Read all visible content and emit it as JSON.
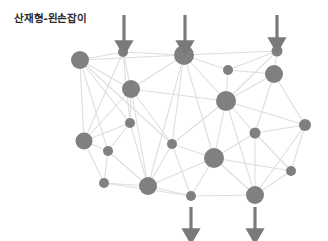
{
  "figure": {
    "title": "산재형-왼손잡이",
    "background_color": "#ffffff",
    "title_color": "#2b2b2b"
  },
  "chart_data": {
    "type": "scatter",
    "title": "산재형-왼손잡이",
    "subtitle": "",
    "xlabel": "",
    "ylabel": "",
    "grid": false,
    "legend": null,
    "xlim": [
      0,
      328
    ],
    "ylim": [
      0,
      241
    ],
    "node_color": "#808080",
    "edge_color": "#dedede",
    "arrow_color": "#7a7a7a",
    "node_count": 20,
    "edge_count": 53,
    "arrow_count": 5,
    "nodes": [
      {
        "id": "n1",
        "x": 80,
        "y": 60,
        "r": 9.0
      },
      {
        "id": "n2",
        "x": 123,
        "y": 52,
        "r": 5.0
      },
      {
        "id": "n3",
        "x": 184,
        "y": 55,
        "r": 10.0
      },
      {
        "id": "n4",
        "x": 277,
        "y": 51,
        "r": 5.5
      },
      {
        "id": "n5",
        "x": 131,
        "y": 89,
        "r": 9.0
      },
      {
        "id": "n6",
        "x": 228,
        "y": 70,
        "r": 5.0
      },
      {
        "id": "n7",
        "x": 274,
        "y": 74,
        "r": 9.0
      },
      {
        "id": "n8",
        "x": 226,
        "y": 101,
        "r": 10.0
      },
      {
        "id": "n9",
        "x": 130,
        "y": 123,
        "r": 5.0
      },
      {
        "id": "n10",
        "x": 255,
        "y": 133,
        "r": 5.5
      },
      {
        "id": "n11",
        "x": 305,
        "y": 125,
        "r": 6.0
      },
      {
        "id": "n12",
        "x": 84,
        "y": 141,
        "r": 8.5
      },
      {
        "id": "n13",
        "x": 108,
        "y": 151,
        "r": 5.0
      },
      {
        "id": "n14",
        "x": 172,
        "y": 144,
        "r": 5.0
      },
      {
        "id": "n15",
        "x": 214,
        "y": 158,
        "r": 10.0
      },
      {
        "id": "n16",
        "x": 291,
        "y": 171,
        "r": 5.0
      },
      {
        "id": "n17",
        "x": 104,
        "y": 183,
        "r": 5.0
      },
      {
        "id": "n18",
        "x": 148,
        "y": 186,
        "r": 9.0
      },
      {
        "id": "n19",
        "x": 191,
        "y": 196,
        "r": 5.0
      },
      {
        "id": "n20",
        "x": 255,
        "y": 195,
        "r": 9.0
      }
    ],
    "edges": [
      [
        "n1",
        "n2"
      ],
      [
        "n1",
        "n5"
      ],
      [
        "n1",
        "n3"
      ],
      [
        "n1",
        "n12"
      ],
      [
        "n1",
        "n9"
      ],
      [
        "n1",
        "n14"
      ],
      [
        "n1",
        "n13"
      ],
      [
        "n2",
        "n3"
      ],
      [
        "n2",
        "n5"
      ],
      [
        "n2",
        "n9"
      ],
      [
        "n2",
        "n12"
      ],
      [
        "n3",
        "n4"
      ],
      [
        "n3",
        "n6"
      ],
      [
        "n3",
        "n5"
      ],
      [
        "n3",
        "n8"
      ],
      [
        "n3",
        "n14"
      ],
      [
        "n3",
        "n18"
      ],
      [
        "n3",
        "n15"
      ],
      [
        "n4",
        "n7"
      ],
      [
        "n4",
        "n6"
      ],
      [
        "n4",
        "n8"
      ],
      [
        "n5",
        "n9"
      ],
      [
        "n5",
        "n14"
      ],
      [
        "n5",
        "n8"
      ],
      [
        "n5",
        "n12"
      ],
      [
        "n5",
        "n18"
      ],
      [
        "n6",
        "n7"
      ],
      [
        "n6",
        "n8"
      ],
      [
        "n7",
        "n8"
      ],
      [
        "n7",
        "n10"
      ],
      [
        "n7",
        "n11"
      ],
      [
        "n8",
        "n10"
      ],
      [
        "n8",
        "n11"
      ],
      [
        "n8",
        "n15"
      ],
      [
        "n8",
        "n14"
      ],
      [
        "n8",
        "n20"
      ],
      [
        "n9",
        "n12"
      ],
      [
        "n9",
        "n13"
      ],
      [
        "n9",
        "n18"
      ],
      [
        "n10",
        "n11"
      ],
      [
        "n10",
        "n15"
      ],
      [
        "n10",
        "n20"
      ],
      [
        "n10",
        "n16"
      ],
      [
        "n11",
        "n16"
      ],
      [
        "n11",
        "n20"
      ],
      [
        "n12",
        "n13"
      ],
      [
        "n12",
        "n17"
      ],
      [
        "n13",
        "n17"
      ],
      [
        "n13",
        "n18"
      ],
      [
        "n14",
        "n15"
      ],
      [
        "n14",
        "n18"
      ],
      [
        "n14",
        "n19"
      ],
      [
        "n15",
        "n19"
      ],
      [
        "n15",
        "n20"
      ],
      [
        "n15",
        "n18"
      ],
      [
        "n15",
        "n16"
      ],
      [
        "n16",
        "n20"
      ],
      [
        "n17",
        "n18"
      ],
      [
        "n17",
        "n19"
      ],
      [
        "n18",
        "n19"
      ],
      [
        "n19",
        "n20"
      ]
    ],
    "arrows": [
      {
        "id": "a1",
        "label": "top-arrow-1",
        "x": 124,
        "y_start": 15,
        "y_end": 44,
        "direction": "down"
      },
      {
        "id": "a2",
        "label": "top-arrow-2",
        "x": 185,
        "y_start": 15,
        "y_end": 44,
        "direction": "down"
      },
      {
        "id": "a3",
        "label": "top-arrow-3",
        "x": 277,
        "y_start": 15,
        "y_end": 41,
        "direction": "down"
      },
      {
        "id": "a4",
        "label": "bottom-arrow-1",
        "x": 191,
        "y_start": 207,
        "y_end": 232,
        "direction": "down"
      },
      {
        "id": "a5",
        "label": "bottom-arrow-2",
        "x": 255,
        "y_start": 207,
        "y_end": 232,
        "direction": "down"
      }
    ]
  }
}
